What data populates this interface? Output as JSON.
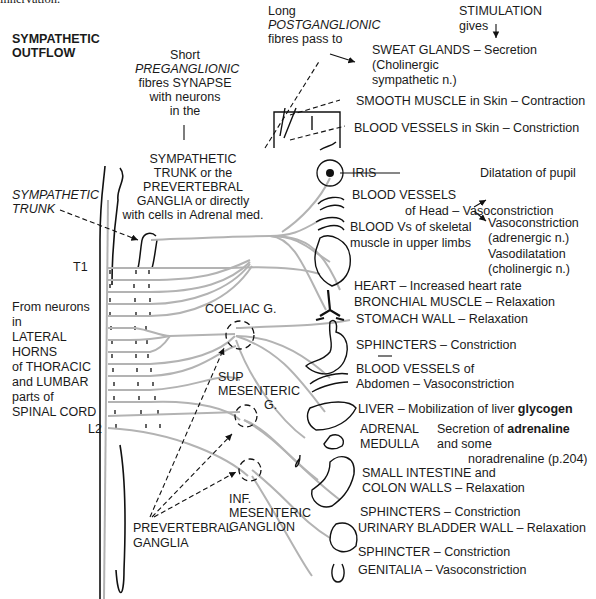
{
  "header": {
    "cut_text": "innervation.",
    "title_line1": "SYMPATHETIC",
    "title_line2": "OUTFLOW"
  },
  "preganglionic_note": {
    "line1": "Short",
    "line2": "PREGANGLIONIC",
    "line3": "fibres SYNAPSE",
    "line4": "with neurons",
    "line5": "in the"
  },
  "synapse_sites": {
    "line1": "SYMPATHETIC",
    "line2": "TRUNK or the",
    "line3": "PREVERTEBRAL",
    "line4": "GANGLIA or directly",
    "line5": "with cells in Adrenal med."
  },
  "postganglionic_note": {
    "line1": "Long",
    "line2": "POSTGANGLIONIC",
    "line3": "fibres pass to"
  },
  "stimulation_note": {
    "line1": "STIMULATION",
    "line2": "gives"
  },
  "left_labels": {
    "sympathetic_trunk_1": "SYMPATHETIC",
    "sympathetic_trunk_2": "TRUNK",
    "t1": "T1",
    "l2": "L2",
    "origin": [
      "From neurons",
      "in",
      "LATERAL",
      "HORNS",
      "of THORACIC",
      "and LUMBAR",
      "parts of",
      "SPINAL CORD"
    ]
  },
  "ganglia": {
    "coeliac": "COELIAC G.",
    "sup_mes_1": "SUP",
    "sup_mes_2": "MESENTERIC",
    "sup_mes_3": "G.",
    "inf_mes_1": "INF.",
    "inf_mes_2": "MESENTERIC",
    "inf_mes_3": "GANGLION",
    "prevertebral_1": "PREVERTEBRAL",
    "prevertebral_2": "GANGLIA"
  },
  "effects": [
    {
      "organ": "SWEAT GLANDS",
      "effect": "– Secretion"
    },
    {
      "organ": "(Cholinergic",
      "effect": ""
    },
    {
      "organ": "sympathetic n.)",
      "effect": ""
    },
    {
      "organ": "SMOOTH MUSCLE in Skin",
      "effect": "– Contraction"
    },
    {
      "organ": "BLOOD VESSELS in Skin",
      "effect": "– Constriction"
    },
    {
      "organ": "IRIS",
      "effect": "Dilatation of pupil"
    },
    {
      "organ": "BLOOD VESSELS",
      "effect": ""
    },
    {
      "organ": "of Head",
      "effect": "– Vasoconstriction"
    },
    {
      "organ": "BLOOD Vs of skeletal",
      "effect": ""
    },
    {
      "organ": "muscle in upper limbs",
      "effect": ""
    },
    {
      "organ": "Vasoconstriction",
      "effect": "(adrenergic n.)"
    },
    {
      "organ": "Vasodilatation",
      "effect": "(cholinergic n.)"
    },
    {
      "organ": "HEART",
      "effect": "– Increased heart rate"
    },
    {
      "organ": "BRONCHIAL MUSCLE",
      "effect": "– Relaxation"
    },
    {
      "organ": "STOMACH WALL",
      "effect": "– Relaxation"
    },
    {
      "organ": "SPHINCTERS",
      "effect": "– Constriction"
    },
    {
      "organ": "BLOOD VESSELS of",
      "effect": ""
    },
    {
      "organ": "Abdomen",
      "effect": "– Vasoconstriction"
    },
    {
      "organ": "LIVER",
      "effect": "– Mobilization of liver",
      "bold": "glycogen"
    },
    {
      "organ": "ADRENAL",
      "effect": "Secretion of",
      "bold": "adrenaline"
    },
    {
      "organ": "MEDULLA",
      "effect": "and some"
    },
    {
      "organ": "",
      "effect": "noradrenaline (p.204)"
    },
    {
      "organ": "SMALL INTESTINE and",
      "effect": ""
    },
    {
      "organ": "COLON WALLS",
      "effect": "– Relaxation"
    },
    {
      "organ": "SPHINCTERS",
      "effect": "– Constriction"
    },
    {
      "organ": "URINARY BLADDER WALL",
      "effect": "– Relaxation"
    },
    {
      "organ": "SPHINCTER",
      "effect": "– Constriction"
    },
    {
      "organ": "GENITALIA",
      "effect": "– Vasoconstriction"
    }
  ],
  "colors": {
    "text": "#1a1a1a",
    "fibre": "#b3b3b3",
    "outline": "#111111"
  }
}
